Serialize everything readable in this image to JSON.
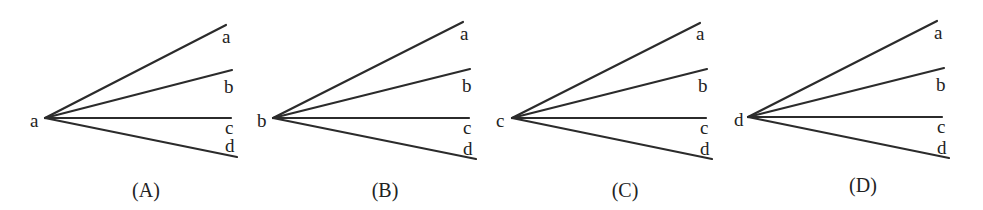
{
  "diagram": {
    "panels": [
      {
        "caption": "(A)",
        "origin_label": "a",
        "ray_labels": [
          "a",
          "b",
          "c",
          "d"
        ]
      },
      {
        "caption": "(B)",
        "origin_label": "b",
        "ray_labels": [
          "a",
          "b",
          "c",
          "d"
        ]
      },
      {
        "caption": "(C)",
        "origin_label": "c",
        "ray_labels": [
          "a",
          "b",
          "c",
          "d"
        ]
      },
      {
        "caption": "(D)",
        "origin_label": "d",
        "ray_labels": [
          "a",
          "b",
          "c",
          "d"
        ]
      }
    ],
    "line_color": "#2b2b2b"
  }
}
